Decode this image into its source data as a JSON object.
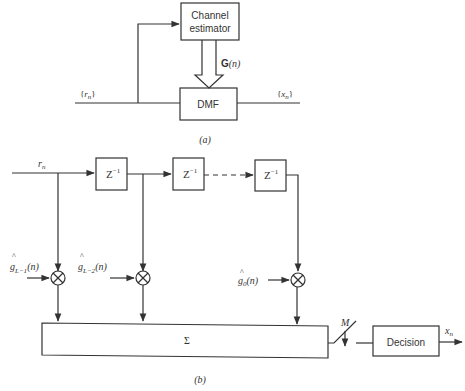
{
  "part_a": {
    "caption": "(a)",
    "channel_estimator": {
      "line1": "Channel",
      "line2": "estimator"
    },
    "dmf": {
      "label": "DMF"
    },
    "gain_label": {
      "bold": "G",
      "rest": "(n)"
    },
    "input_label": {
      "open": "{",
      "var": "r",
      "sub": "n",
      "close": "}"
    },
    "output_label": {
      "open": "{",
      "var": "x",
      "sub": "n",
      "close": "}"
    }
  },
  "part_b": {
    "caption": "(b)",
    "input_label": {
      "var": "r",
      "sub": "n"
    },
    "delays": [
      {
        "base": "Z",
        "sup": "−1"
      },
      {
        "base": "Z",
        "sup": "−1"
      },
      {
        "base": "Z",
        "sup": "−1"
      }
    ],
    "tap_weights": [
      {
        "hat": "^",
        "var": "g",
        "sub": "L−1",
        "arg": "(n)"
      },
      {
        "hat": "^",
        "var": "g",
        "sub": "L−2",
        "arg": "(n)"
      },
      {
        "hat": "^",
        "var": "g",
        "sub": "0",
        "arg": "(n)"
      }
    ],
    "summer": {
      "label": "Σ"
    },
    "switch_label": "M",
    "decision": {
      "label": "Decision"
    },
    "output_label": {
      "var": "x",
      "sub": "n"
    }
  },
  "colors": {
    "stroke": "#333333",
    "background": "#ffffff"
  }
}
